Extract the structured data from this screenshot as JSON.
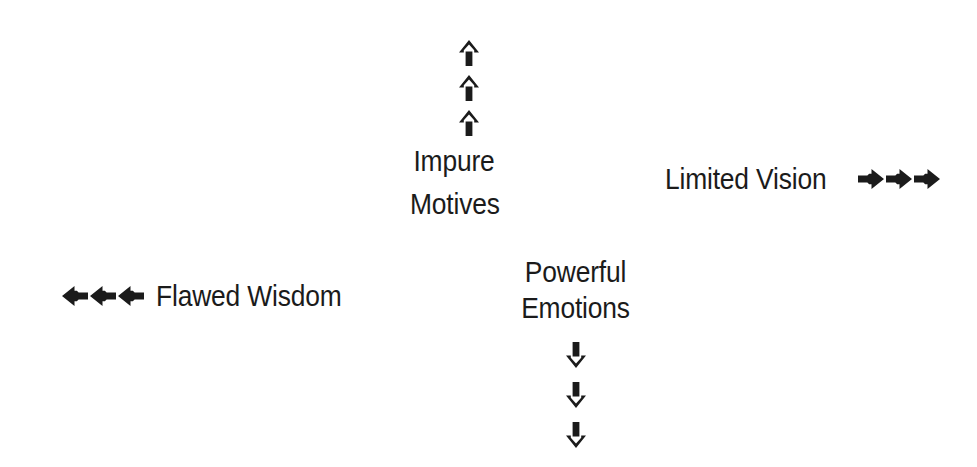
{
  "canvas": {
    "width": 977,
    "height": 467,
    "background_color": "#ffffff",
    "ink_color": "#1b1b1b"
  },
  "diagram": {
    "type": "radial-arrow-labels",
    "groups": [
      {
        "id": "up",
        "label": "Impure Motives",
        "label_lines": [
          "Impure",
          "Motives"
        ],
        "arrow_direction": "up",
        "arrow_glyph": "up-arrow",
        "arrow_count": 3,
        "arrows_position": "above-label"
      },
      {
        "id": "right",
        "label": "Limited Vision",
        "label_lines": [
          "Limited Vision"
        ],
        "arrow_direction": "right",
        "arrow_glyph": "right-arrow",
        "arrow_count": 3,
        "arrows_position": "after-label"
      },
      {
        "id": "left",
        "label": "Flawed Wisdom",
        "label_lines": [
          "Flawed Wisdom"
        ],
        "arrow_direction": "left",
        "arrow_glyph": "left-arrow",
        "arrow_count": 3,
        "arrows_position": "before-label"
      },
      {
        "id": "down",
        "label": "Powerful Emotions",
        "label_lines": [
          "Powerful",
          "Emotions"
        ],
        "arrow_direction": "down",
        "arrow_glyph": "down-arrow",
        "arrow_count": 3,
        "arrows_position": "below-label"
      }
    ]
  }
}
